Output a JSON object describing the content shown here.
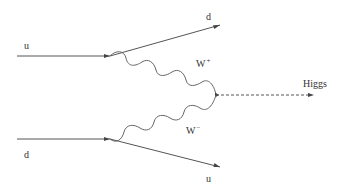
{
  "diagram": {
    "type": "feynman",
    "particles": {
      "incoming_top": "u",
      "outgoing_top": "d",
      "boson_top": "W",
      "boson_top_charge": "+",
      "higgs": "Higgs",
      "boson_bottom": "W",
      "boson_bottom_charge": "−",
      "incoming_bottom": "d",
      "outgoing_bottom": "u"
    },
    "colors": {
      "line": "#555555",
      "text": "#333333",
      "background": "#ffffff"
    }
  }
}
